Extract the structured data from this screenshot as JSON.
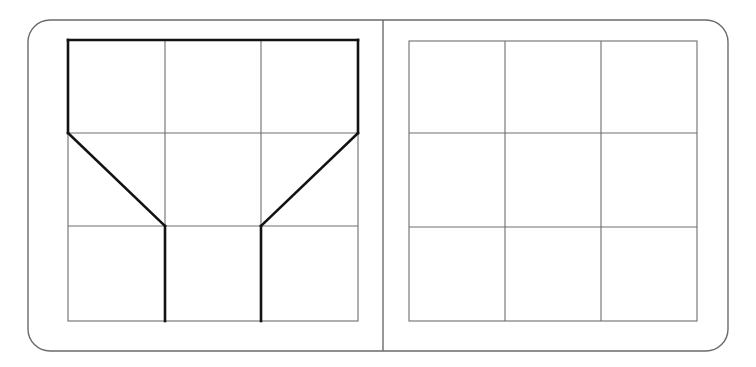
{
  "page": {
    "background_color": "#ffffff",
    "width": 756,
    "height": 367
  },
  "colors": {
    "card_border": "#6b6b6b",
    "grid_line": "#6e6e6e",
    "shape_stroke": "#121212",
    "background": "#ffffff"
  },
  "card": {
    "label": "rounded-card",
    "x": 28,
    "y": 20,
    "width": 700,
    "height": 331,
    "corner_radius": 22,
    "stroke_width": 1.4
  },
  "divider": {
    "label": "panel-divider",
    "x": 383,
    "y1": 20,
    "y2": 351,
    "stroke_width": 1.4
  },
  "panels": [
    {
      "id": "left-panel",
      "label": "Left panel",
      "grid": {
        "x": 68,
        "y": 40,
        "width": 290,
        "height": 281,
        "columns": 3,
        "rows": 3,
        "col_x": [
          68,
          165,
          261,
          358
        ],
        "row_y": [
          40,
          133,
          226,
          321
        ],
        "line_width": 1.1
      },
      "shape": {
        "id": "funnel-shape",
        "label": "Bold funnel outline",
        "stroke_width": 2.6,
        "segments": [
          {
            "name": "top-edge",
            "type": "line",
            "x1": 68,
            "y1": 40,
            "x2": 358,
            "y2": 40
          },
          {
            "name": "left-edge",
            "type": "line",
            "x1": 68,
            "y1": 40,
            "x2": 68,
            "y2": 133
          },
          {
            "name": "right-edge",
            "type": "line",
            "x1": 358,
            "y1": 40,
            "x2": 358,
            "y2": 133
          },
          {
            "name": "left-diagonal",
            "type": "line",
            "x1": 68,
            "y1": 133,
            "x2": 165,
            "y2": 226
          },
          {
            "name": "right-diagonal",
            "type": "line",
            "x1": 358,
            "y1": 133,
            "x2": 261,
            "y2": 226
          },
          {
            "name": "left-vertical",
            "type": "line",
            "x1": 165,
            "y1": 226,
            "x2": 165,
            "y2": 321
          },
          {
            "name": "right-vertical",
            "type": "line",
            "x1": 261,
            "y1": 226,
            "x2": 261,
            "y2": 321
          }
        ]
      }
    },
    {
      "id": "right-panel",
      "label": "Right panel",
      "grid": {
        "x": 409,
        "y": 41,
        "width": 288,
        "height": 280,
        "columns": 3,
        "rows": 3,
        "col_x": [
          409,
          505,
          601,
          697
        ],
        "row_y": [
          41,
          133,
          227,
          321
        ],
        "line_width": 1.1
      },
      "shape": null
    }
  ]
}
